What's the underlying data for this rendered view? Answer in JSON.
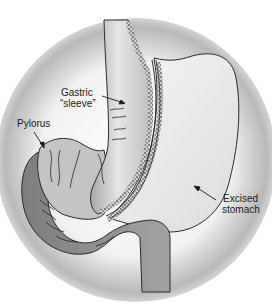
{
  "figure": {
    "labels": {
      "gastric_sleeve": {
        "line1": "Gastric",
        "line2": "“sleeve”"
      },
      "pylorus": {
        "text": "Pylorus"
      },
      "excised_stomach": {
        "line1": "Excised",
        "line2": "stomach"
      }
    },
    "colors": {
      "background_vignette": "#9a9a9a",
      "sleeve_fill": "#c8c8c8",
      "excised_fill": "#ececec",
      "duodenum_fill": "#8e8e8e",
      "outline": "#2a2a2a",
      "staple_line": "#6a6a6a"
    }
  }
}
